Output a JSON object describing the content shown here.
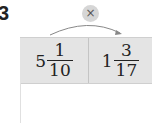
{
  "question_number": "3",
  "operation": {
    "symbol": "×",
    "icon": "multiply-icon"
  },
  "cells": [
    {
      "whole": "5",
      "numerator": "1",
      "denominator": "10"
    },
    {
      "whole": "1",
      "numerator": "3",
      "denominator": "17"
    }
  ]
}
